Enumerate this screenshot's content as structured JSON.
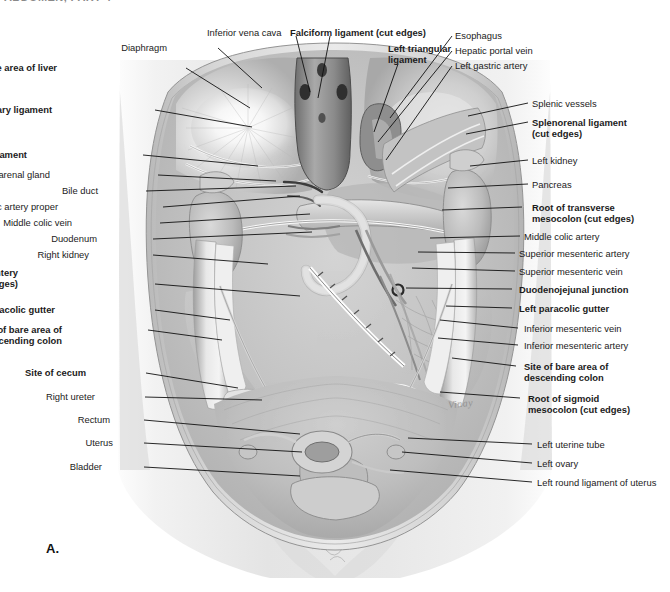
{
  "page": {
    "running_header": "ABDOMEN, PART 4",
    "figure_letter": "A.",
    "signature": "Vinay",
    "background_color": "#ffffff",
    "ink_color": "#1b1b1b",
    "width": 670,
    "height": 592
  },
  "figure": {
    "view": "anterior view of opened abdominopelvic cavity, viscera removed",
    "style": "grayscale medical illustration"
  },
  "labels_left": [
    {
      "id": "site-of-bare-area-of-liver",
      "text": "Site of bare area of liver",
      "text2": "",
      "bold": true,
      "x": 57,
      "y": 63,
      "lx": 186,
      "ly": 68,
      "tx": 250,
      "ty": 108
    },
    {
      "id": "diaphragm",
      "text": "Diaphragm",
      "text2": "",
      "bold": false,
      "x": 167,
      "y": 43,
      "lx": 218,
      "ly": 48,
      "tx": 262,
      "ty": 88
    },
    {
      "id": "coronary-ligament",
      "text": "Coronary ligament",
      "text2": "",
      "bold": true,
      "x": 52,
      "y": 105,
      "lx": 155,
      "ly": 110,
      "tx": 252,
      "ty": 127
    },
    {
      "id": "right-triangular-ligament",
      "text": "Right triangular ligament",
      "text2": "",
      "bold": true,
      "x": 27,
      "y": 150,
      "lx": 143,
      "ly": 155,
      "tx": 258,
      "ty": 166
    },
    {
      "id": "right-suprarenal-gland",
      "text": "Right suprarenal gland",
      "text2": "",
      "bold": false,
      "x": 50,
      "y": 170,
      "lx": 158,
      "ly": 175,
      "tx": 276,
      "ty": 181
    },
    {
      "id": "bile-duct",
      "text": "Bile duct",
      "text2": "",
      "bold": false,
      "x": 98,
      "y": 186,
      "lx": 146,
      "ly": 191,
      "tx": 296,
      "ty": 186
    },
    {
      "id": "hepatic-artery-proper",
      "text": "Hepatic artery proper",
      "text2": "",
      "bold": false,
      "x": 58,
      "y": 202,
      "lx": 163,
      "ly": 207,
      "tx": 300,
      "ty": 196
    },
    {
      "id": "middle-colic-vein",
      "text": "Middle colic vein",
      "text2": "",
      "bold": false,
      "x": 72,
      "y": 218,
      "lx": 160,
      "ly": 223,
      "tx": 310,
      "ty": 214
    },
    {
      "id": "duodenum",
      "text": "Duodenum",
      "text2": "",
      "bold": false,
      "x": 97,
      "y": 234,
      "lx": 153,
      "ly": 239,
      "tx": 312,
      "ty": 232
    },
    {
      "id": "right-kidney",
      "text": "Right kidney",
      "text2": "",
      "bold": false,
      "x": 89,
      "y": 250,
      "lx": 153,
      "ly": 255,
      "tx": 268,
      "ty": 264
    },
    {
      "id": "root-of-mesentery",
      "text": "Root of mesentery",
      "text2": "of small intestine (cut edges)",
      "bold": true,
      "x": 18,
      "y": 268,
      "lx": 155,
      "ly": 284,
      "tx": 300,
      "ty": 296
    },
    {
      "id": "right-paracolic-gutter",
      "text": "Right paracolic gutter",
      "text2": "",
      "bold": true,
      "x": 55,
      "y": 305,
      "lx": 155,
      "ly": 310,
      "tx": 230,
      "ty": 320
    },
    {
      "id": "site-of-bare-area-asc-colon",
      "text": "Site of bare area of",
      "text2": "ascending colon",
      "bold": true,
      "x": 62,
      "y": 325,
      "lx": 148,
      "ly": 330,
      "tx": 222,
      "ty": 340
    },
    {
      "id": "site-of-cecum",
      "text": "Site of cecum",
      "text2": "",
      "bold": true,
      "x": 86,
      "y": 368,
      "lx": 146,
      "ly": 373,
      "tx": 238,
      "ty": 388
    },
    {
      "id": "right-ureter",
      "text": "Right ureter",
      "text2": "",
      "bold": false,
      "x": 95,
      "y": 392,
      "lx": 145,
      "ly": 397,
      "tx": 262,
      "ty": 400
    },
    {
      "id": "rectum",
      "text": "Rectum",
      "text2": "",
      "bold": false,
      "x": 110,
      "y": 415,
      "lx": 144,
      "ly": 420,
      "tx": 300,
      "ty": 434
    },
    {
      "id": "uterus",
      "text": "Uterus",
      "text2": "",
      "bold": false,
      "x": 113,
      "y": 438,
      "lx": 144,
      "ly": 443,
      "tx": 302,
      "ty": 452
    },
    {
      "id": "bladder",
      "text": "Bladder",
      "text2": "",
      "bold": false,
      "x": 102,
      "y": 462,
      "lx": 144,
      "ly": 467,
      "tx": 300,
      "ty": 476
    }
  ],
  "labels_top": [
    {
      "id": "inferior-vena-cava",
      "text": "Inferior vena cava",
      "text2": "",
      "bold": false,
      "x": 207,
      "y": 28,
      "lx": 296,
      "ly": 36,
      "tx": 310,
      "ty": 92
    },
    {
      "id": "falciform-ligament",
      "text": "Falciform ligament (cut edges)",
      "text2": "",
      "bold": true,
      "x": 290,
      "y": 28,
      "lx": 330,
      "ly": 36,
      "tx": 318,
      "ty": 98
    },
    {
      "id": "left-triangular-ligament",
      "text": "Left triangular",
      "text2": "ligament",
      "bold": true,
      "x": 388,
      "y": 44,
      "lx": 398,
      "ly": 64,
      "tx": 374,
      "ty": 132
    },
    {
      "id": "esophagus",
      "text": "Esophagus",
      "text2": "",
      "bold": false,
      "x": 455,
      "y": 31,
      "lx": 452,
      "ly": 36,
      "tx": 390,
      "ty": 118
    },
    {
      "id": "hepatic-portal-vein",
      "text": "Hepatic portal vein",
      "text2": "",
      "bold": false,
      "x": 455,
      "y": 46,
      "lx": 452,
      "ly": 51,
      "tx": 378,
      "ty": 142
    },
    {
      "id": "left-gastric-artery",
      "text": "Left gastric artery",
      "text2": "",
      "bold": false,
      "x": 455,
      "y": 61,
      "lx": 452,
      "ly": 66,
      "tx": 386,
      "ty": 160
    }
  ],
  "labels_right": [
    {
      "id": "splenic-vessels",
      "text": "Splenic vessels",
      "text2": "",
      "bold": false,
      "x": 532,
      "y": 99,
      "lx": 528,
      "ly": 103,
      "tx": 468,
      "ty": 116
    },
    {
      "id": "splenorenal-ligament",
      "text": "Splenorenal ligament",
      "text2": "(cut edges)",
      "bold": true,
      "x": 532,
      "y": 118,
      "lx": 528,
      "ly": 122,
      "tx": 466,
      "ty": 134
    },
    {
      "id": "left-kidney",
      "text": "Left kidney",
      "text2": "",
      "bold": false,
      "x": 532,
      "y": 156,
      "lx": 528,
      "ly": 160,
      "tx": 470,
      "ty": 166
    },
    {
      "id": "pancreas",
      "text": "Pancreas",
      "text2": "",
      "bold": false,
      "x": 532,
      "y": 180,
      "lx": 528,
      "ly": 184,
      "tx": 448,
      "ty": 188
    },
    {
      "id": "root-of-transverse-mesocolon",
      "text": "Root of transverse",
      "text2": "mesocolon (cut edges)",
      "bold": true,
      "x": 532,
      "y": 203,
      "lx": 522,
      "ly": 207,
      "tx": 442,
      "ty": 210
    },
    {
      "id": "middle-colic-artery",
      "text": "Middle colic artery",
      "text2": "",
      "bold": false,
      "x": 524,
      "y": 232,
      "lx": 520,
      "ly": 236,
      "tx": 430,
      "ty": 238
    },
    {
      "id": "superior-mesenteric-artery",
      "text": "Superior mesenteric artery",
      "text2": "",
      "bold": false,
      "x": 519,
      "y": 249,
      "lx": 515,
      "ly": 253,
      "tx": 418,
      "ty": 252
    },
    {
      "id": "superior-mesenteric-vein",
      "text": "Superior mesenteric vein",
      "text2": "",
      "bold": false,
      "x": 519,
      "y": 267,
      "lx": 515,
      "ly": 271,
      "tx": 412,
      "ty": 268
    },
    {
      "id": "duodenojejunal-junction",
      "text": "Duodenojejunal junction",
      "text2": "",
      "bold": true,
      "x": 519,
      "y": 285,
      "lx": 512,
      "ly": 289,
      "tx": 406,
      "ty": 288
    },
    {
      "id": "left-paracolic-gutter",
      "text": "Left paracolic gutter",
      "text2": "",
      "bold": true,
      "x": 519,
      "y": 304,
      "lx": 512,
      "ly": 308,
      "tx": 446,
      "ty": 306
    },
    {
      "id": "inferior-mesenteric-vein",
      "text": "Inferior mesenteric vein",
      "text2": "",
      "bold": false,
      "x": 524,
      "y": 324,
      "lx": 518,
      "ly": 328,
      "tx": 440,
      "ty": 320
    },
    {
      "id": "inferior-mesenteric-artery",
      "text": "Inferior mesenteric artery",
      "text2": "",
      "bold": false,
      "x": 524,
      "y": 341,
      "lx": 518,
      "ly": 345,
      "tx": 438,
      "ty": 338
    },
    {
      "id": "site-of-bare-area-desc-colon",
      "text": "Site of bare area of",
      "text2": "descending colon",
      "bold": true,
      "x": 524,
      "y": 362,
      "lx": 516,
      "ly": 366,
      "tx": 452,
      "ty": 358
    },
    {
      "id": "root-of-sigmoid-mesocolon",
      "text": "Root of sigmoid",
      "text2": "mesocolon (cut edges)",
      "bold": true,
      "x": 528,
      "y": 394,
      "lx": 520,
      "ly": 398,
      "tx": 440,
      "ty": 392
    },
    {
      "id": "left-uterine-tube",
      "text": "Left uterine tube",
      "text2": "",
      "bold": false,
      "x": 537,
      "y": 440,
      "lx": 532,
      "ly": 444,
      "tx": 408,
      "ty": 438
    },
    {
      "id": "left-ovary",
      "text": "Left ovary",
      "text2": "",
      "bold": false,
      "x": 537,
      "y": 459,
      "lx": 532,
      "ly": 463,
      "tx": 402,
      "ty": 452
    },
    {
      "id": "left-round-ligament-uterus",
      "text": "Left round ligament of uterus",
      "text2": "",
      "bold": false,
      "x": 537,
      "y": 478,
      "lx": 532,
      "ly": 482,
      "tx": 390,
      "ty": 470
    }
  ]
}
